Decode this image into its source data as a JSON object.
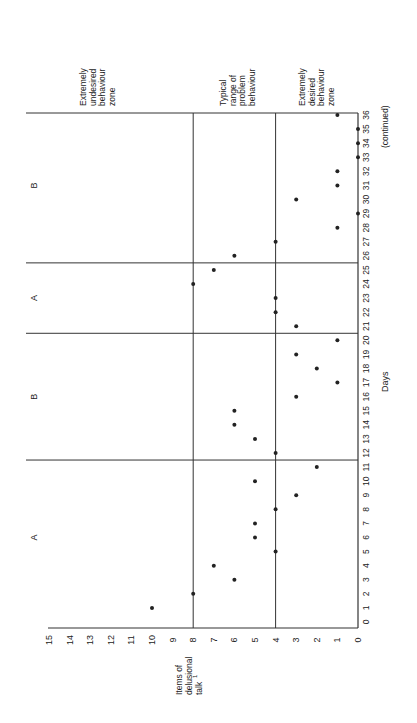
{
  "chart_data": {
    "type": "scatter",
    "title": "",
    "orientation": "rotated-90-ccw (printed sideways)",
    "xlabel": "Days",
    "xlabel_note": "(continued)",
    "ylabel": "Items of delusional talk",
    "ylabel_footnote": "1",
    "xlim": [
      0,
      36
    ],
    "ylim": [
      0,
      15
    ],
    "x_ticks": [
      0,
      1,
      2,
      3,
      4,
      5,
      6,
      7,
      8,
      9,
      10,
      11,
      12,
      13,
      14,
      15,
      16,
      17,
      18,
      19,
      20,
      21,
      22,
      23,
      24,
      25,
      26,
      27,
      28,
      29,
      30,
      31,
      32,
      33,
      34,
      35,
      36
    ],
    "y_ticks": [
      0,
      1,
      2,
      3,
      4,
      5,
      6,
      7,
      8,
      9,
      10,
      11,
      12,
      13,
      14,
      15
    ],
    "grid": false,
    "phases": [
      {
        "label": "A",
        "start": 1,
        "end": 11
      },
      {
        "label": "B",
        "start": 12,
        "end": 20
      },
      {
        "label": "A",
        "start": 21,
        "end": 25
      },
      {
        "label": "B",
        "start": 26,
        "end": 36
      }
    ],
    "phase_boundaries": [
      11.5,
      20.5,
      25.5
    ],
    "zone_lines": [
      4,
      8
    ],
    "zones": [
      {
        "label": "Extremely undesired behaviour zone",
        "range": [
          8,
          15
        ]
      },
      {
        "label": "Typical range of problem behaviour",
        "range": [
          4,
          8
        ]
      },
      {
        "label": "Extremely desired behaviour zone",
        "range": [
          0,
          4
        ]
      }
    ],
    "series": [
      {
        "name": "Items of delusional talk",
        "x": [
          1,
          2,
          3,
          4,
          5,
          6,
          7,
          8,
          9,
          10,
          11,
          12,
          13,
          14,
          15,
          16,
          17,
          18,
          19,
          20,
          21,
          22,
          23,
          24,
          25,
          26,
          27,
          28,
          29,
          30,
          31,
          32,
          33,
          34,
          35,
          36
        ],
        "y": [
          10,
          8,
          6,
          7,
          4,
          5,
          5,
          4,
          3,
          5,
          2,
          4,
          5,
          6,
          6,
          3,
          1,
          2,
          3,
          1,
          3,
          4,
          4,
          8,
          7,
          6,
          4,
          1,
          0,
          3,
          1,
          1,
          0,
          0,
          0,
          1
        ]
      }
    ]
  },
  "labels": {
    "ylabel_line1": "Items of",
    "ylabel_line2": "delusional",
    "ylabel_line3": "talk",
    "ylabel_sup": "1",
    "xlabel": "Days",
    "continued": "(continued)",
    "zone_undesired": [
      "Extremely",
      "undesired",
      "behaviour",
      "zone"
    ],
    "zone_typical": [
      "Typical",
      "range of",
      "problem",
      "behaviour"
    ],
    "zone_desired": [
      "Extremely",
      "desired",
      "behaviour",
      "zone"
    ]
  },
  "colors": {
    "ink": "#222222",
    "axis": "#333333",
    "days_label": "#2f6b5e"
  }
}
